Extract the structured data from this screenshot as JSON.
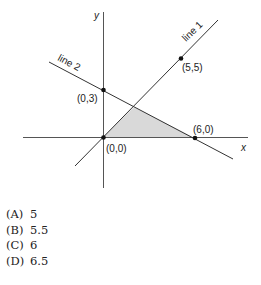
{
  "figure": {
    "axis_labels": {
      "x": "x",
      "y": "y"
    },
    "lines": [
      {
        "name": "line 1",
        "label": "line 1"
      },
      {
        "name": "line 2",
        "label": "line 2"
      }
    ],
    "points": [
      {
        "label": "(0,0)"
      },
      {
        "label": "(0,3)"
      },
      {
        "label": "(5,5)"
      },
      {
        "label": "(6,0)"
      }
    ],
    "shaded_region_color": "#d9d9d9",
    "line_color": "#333333"
  },
  "choices": [
    {
      "letter": "(A)",
      "value": "5"
    },
    {
      "letter": "(B)",
      "value": "5.5"
    },
    {
      "letter": "(C)",
      "value": "6"
    },
    {
      "letter": "(D)",
      "value": "6.5"
    }
  ]
}
